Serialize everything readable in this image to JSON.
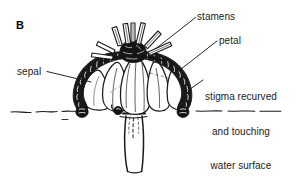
{
  "figure": {
    "panel_label": "B",
    "background_color": "#ffffff",
    "ink_color": "#111111",
    "labels": [
      {
        "id": "stamens",
        "text": "stamens",
        "lines": [
          "stamens"
        ]
      },
      {
        "id": "petal",
        "text": "petal",
        "lines": [
          "petal"
        ]
      },
      {
        "id": "sepal",
        "text": "sepal",
        "lines": [
          "sepal"
        ]
      },
      {
        "id": "stigma",
        "text": "stigma recurved and touching water surface",
        "lines": [
          "stigma recurved",
          "and touching",
          "water surface"
        ]
      }
    ],
    "parts": [
      {
        "name": "stamens",
        "description": "cluster of narrow stamens rising from flower centre"
      },
      {
        "name": "petal",
        "description": "broad cupped petals forming the corolla"
      },
      {
        "name": "sepal",
        "description": "beaded recurved sepals arching outward and down"
      },
      {
        "name": "stigma",
        "description": "recurved stigma touching the water surface"
      },
      {
        "name": "water-surface",
        "description": "wavy dashed horizontal water line"
      },
      {
        "name": "peduncle",
        "description": "stem descending below the water surface"
      }
    ]
  }
}
